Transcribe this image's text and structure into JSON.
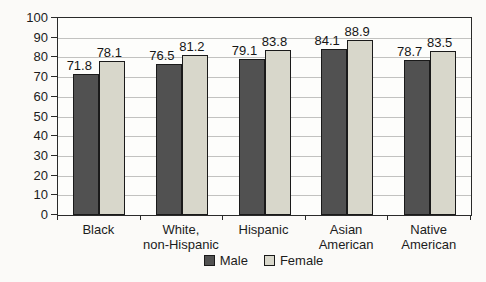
{
  "chart_data": {
    "type": "bar",
    "title": "",
    "xlabel": "",
    "ylabel": "Age in years",
    "ylim": [
      0,
      100
    ],
    "ytick_step": 10,
    "grid": "horizontal",
    "legend_position": "bottom",
    "value_labels_shown": true,
    "categories": [
      "Black",
      "White,\nnon-Hispanic",
      "Hispanic",
      "Asian\nAmerican",
      "Native\nAmerican"
    ],
    "series": [
      {
        "name": "Male",
        "color": "#515151",
        "values": [
          71.8,
          76.5,
          79.1,
          84.1,
          78.7
        ]
      },
      {
        "name": "Female",
        "color": "#d8d7cb",
        "values": [
          78.1,
          81.2,
          83.8,
          88.9,
          83.5
        ]
      }
    ],
    "colors": {
      "plot_border": "#2a2a2a",
      "gridline": "#c2c2c0",
      "text": "#1c1c1c",
      "background": "#fbfaf8"
    }
  }
}
